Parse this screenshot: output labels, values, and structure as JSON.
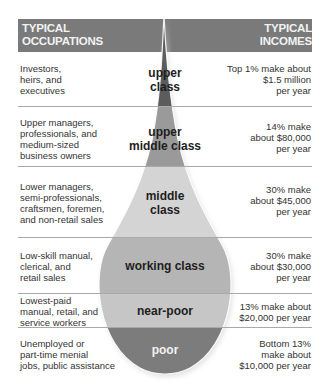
{
  "header": {
    "left_title_line1": "TYPICAL",
    "left_title_line2": "OCCUPATIONS",
    "right_title_line1": "TYPICAL",
    "right_title_line2": "INCOMES",
    "bar_color": "#7a7a7a"
  },
  "tiers": [
    {
      "class_line1": "upper",
      "class_line2": "class",
      "occupations": [
        "Investors,",
        "heirs, and",
        "executives"
      ],
      "income": [
        "Top 1% make about",
        "$1.5 million",
        "per year"
      ],
      "color": "#5c5c5c"
    },
    {
      "class_line1": "upper",
      "class_line2": "middle class",
      "occupations": [
        "Upper managers,",
        "professionals, and",
        "medium-sized",
        "business owners"
      ],
      "income": [
        "14% make",
        "about $80,000",
        "per year"
      ],
      "color": "#9a9a9a"
    },
    {
      "class_line1": "middle",
      "class_line2": "class",
      "occupations": [
        "Lower managers,",
        "semi-professionals,",
        "craftsmen, foremen,",
        "and non-retail sales"
      ],
      "income": [
        "30% make",
        "about $45,000",
        "per year"
      ],
      "color": "#d4d4d4"
    },
    {
      "class_line1": "working class",
      "class_line2": "",
      "occupations": [
        "Low-skill manual,",
        "clerical, and",
        "retail sales"
      ],
      "income": [
        "30% make",
        "about $30,000",
        "per year"
      ],
      "color": "#b5b5b5"
    },
    {
      "class_line1": "near-poor",
      "class_line2": "",
      "occupations": [
        "Lowest-paid",
        "manual, retail, and",
        "service workers"
      ],
      "income": [
        "13% make about",
        "$20,000 per year"
      ],
      "color": "#c6c6c6"
    },
    {
      "class_line1": "poor",
      "class_line2": "",
      "occupations": [
        "Unemployed or",
        "part-time menial",
        "jobs, public assistance"
      ],
      "income": [
        "Bottom 13%",
        "make about",
        "$10,000 per year"
      ],
      "color": "#7c7c7c"
    }
  ]
}
